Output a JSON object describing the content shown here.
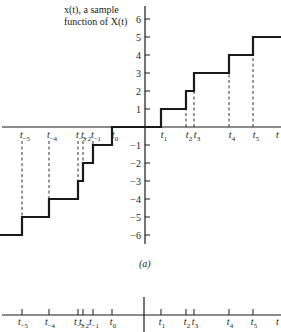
{
  "figure": {
    "annotation_line1": "x(t), a sample",
    "annotation_line2": "function of X(t)",
    "caption": "(a)",
    "t_axis_label": "t"
  },
  "chart_data": [
    {
      "type": "line",
      "subtype": "step",
      "title": "x(t), a sample function of X(t)",
      "xlabel": "t",
      "ylabel": "",
      "ylim": [
        -6,
        6
      ],
      "yticks": [
        -6,
        -5,
        -4,
        -3,
        -2,
        -1,
        1,
        2,
        3,
        4,
        5,
        6
      ],
      "x_ticks": [
        "t_-5",
        "t_-4",
        "t_-3",
        "t_-2",
        "t_-1",
        "t_0",
        "t_1",
        "t_2",
        "t_3",
        "t_4",
        "t_5"
      ],
      "grid": false,
      "series": [
        {
          "name": "x(t)",
          "steps": [
            {
              "from": "-inf",
              "to": "t_-5",
              "value": -6
            },
            {
              "from": "t_-5",
              "to": "t_-4",
              "value": -5
            },
            {
              "from": "t_-4",
              "to": "t_-3",
              "value": -4
            },
            {
              "from": "t_-3",
              "to": "t_-2",
              "value": -3
            },
            {
              "from": "t_-2",
              "to": "t_-1",
              "value": -2
            },
            {
              "from": "t_-1",
              "to": "t_0",
              "value": -1
            },
            {
              "from": "t_0",
              "to": "t_1",
              "value": 0
            },
            {
              "from": "t_1",
              "to": "t_2",
              "value": 1
            },
            {
              "from": "t_2",
              "to": "t_3",
              "value": 2
            },
            {
              "from": "t_3",
              "to": "t_4",
              "value": 3
            },
            {
              "from": "t_4",
              "to": "t_5",
              "value": 4
            },
            {
              "from": "t_5",
              "to": "+inf",
              "value": 5
            }
          ]
        }
      ]
    },
    {
      "type": "scatter",
      "subtype": "event-times axis",
      "title": "",
      "xlabel": "t",
      "points": [
        "t_-5",
        "t_-4",
        "t_-3",
        "t_-2",
        "t_-1",
        "t_0",
        "t_1",
        "t_2",
        "t_3",
        "t_4",
        "t_5"
      ]
    }
  ],
  "layout": {
    "origin_x": 145,
    "zero_y": 127,
    "unit_px": 18,
    "bottom_axis_y": 315,
    "times": [
      {
        "sub": "−5",
        "x": 22
      },
      {
        "sub": "−4",
        "x": 49
      },
      {
        "sub": "−3",
        "x": 78
      },
      {
        "sub": "−2",
        "x": 83
      },
      {
        "sub": "−1",
        "x": 93
      },
      {
        "sub": "0",
        "x": 112
      },
      {
        "sub": "1",
        "x": 161
      },
      {
        "sub": "2",
        "x": 186
      },
      {
        "sub": "3",
        "x": 194
      },
      {
        "sub": "4",
        "x": 229
      },
      {
        "sub": "5",
        "x": 253
      }
    ],
    "levels": [
      -6,
      -5,
      -4,
      -3,
      -2,
      -1,
      0,
      1,
      2,
      3,
      4,
      5
    ]
  }
}
